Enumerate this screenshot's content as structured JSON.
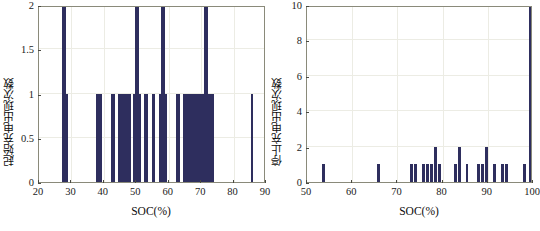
{
  "figure": {
    "background": "#ffffff",
    "bar_color": "#2e2e5e",
    "axis_color": "#8a8a7a",
    "grid_color": "#ecece4"
  },
  "chart_data": [
    {
      "type": "bar",
      "panel": "left",
      "title": "",
      "xlabel": "SOC(%)",
      "ylabel": "起始充电出现次数",
      "xlim": [
        20,
        90
      ],
      "ylim": [
        0,
        2
      ],
      "xticks": [
        20,
        30,
        40,
        50,
        60,
        70,
        80,
        90
      ],
      "xticklabels": [
        "20",
        "30",
        "40",
        "50",
        "60",
        "70",
        "80",
        "90"
      ],
      "yticks": [
        0,
        0.5,
        1,
        1.5,
        2
      ],
      "yticklabels": [
        "0",
        "0.5",
        "1",
        "1.5",
        "2"
      ],
      "grid": true,
      "bar_width": 0.42,
      "x": [
        27.3,
        27.9,
        28.5,
        37.8,
        38.4,
        39.0,
        42.4,
        43.0,
        44.6,
        45.2,
        45.8,
        46.4,
        47.0,
        47.6,
        48.2,
        49.2,
        49.8,
        50.4,
        51.0,
        52.6,
        53.2,
        55.0,
        55.6,
        57.4,
        58.0,
        58.6,
        59.2,
        62.6,
        63.2,
        64.6,
        65.2,
        65.8,
        66.4,
        67.0,
        67.6,
        68.2,
        68.8,
        69.4,
        70.0,
        70.6,
        71.2,
        71.8,
        72.4,
        73.0,
        73.6,
        85.6
      ],
      "values": [
        2,
        2,
        1,
        1,
        1,
        1,
        1,
        1,
        1,
        1,
        1,
        1,
        1,
        1,
        1,
        1,
        2,
        2,
        1,
        1,
        1,
        1,
        1,
        1,
        2,
        2,
        1,
        1,
        1,
        1,
        1,
        1,
        1,
        1,
        1,
        1,
        1,
        1,
        1,
        1,
        2,
        2,
        1,
        1,
        1,
        1
      ]
    },
    {
      "type": "bar",
      "panel": "right",
      "title": "",
      "xlabel": "SOC(%)",
      "ylabel": "停止充电出现次数",
      "xlim": [
        50,
        100
      ],
      "ylim": [
        0,
        10
      ],
      "xticks": [
        50,
        60,
        70,
        80,
        90,
        100
      ],
      "xticklabels": [
        "50",
        "60",
        "70",
        "80",
        "90",
        "100"
      ],
      "yticks": [
        0,
        2,
        4,
        6,
        8,
        10
      ],
      "yticklabels": [
        "0",
        "2",
        "4",
        "6",
        "8",
        "10"
      ],
      "grid": true,
      "bar_width": 0.62,
      "x": [
        53.6,
        65.9,
        73.1,
        74.0,
        75.7,
        76.6,
        77.6,
        78.5,
        79.4,
        82.8,
        83.7,
        85.4,
        88.0,
        88.9,
        89.8,
        91.5,
        93.2,
        94.1,
        98.2,
        99.4
      ],
      "values": [
        1,
        1,
        1,
        1,
        1,
        1,
        1,
        2,
        1,
        1,
        2,
        1,
        1,
        1,
        2,
        1,
        1,
        1,
        1,
        10
      ]
    }
  ]
}
